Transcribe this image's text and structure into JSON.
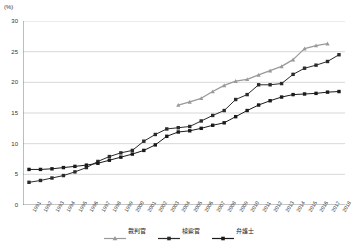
{
  "chart_data": {
    "type": "line",
    "title": "",
    "subtitle": "",
    "xlabel": "",
    "ylabel": "(%)",
    "unit_label": "(%)",
    "ylim": [
      0,
      30
    ],
    "y_ticks": [
      "0",
      "5",
      "10",
      "15",
      "20",
      "25",
      "30"
    ],
    "grid": true,
    "legend_position": "bottom",
    "categories": [
      "1991",
      "1992",
      "1993",
      "1994",
      "1995",
      "1996",
      "1997",
      "1998",
      "1999",
      "2000",
      "2001",
      "2002",
      "2003",
      "2004",
      "2005",
      "2006",
      "2007",
      "2008",
      "2009",
      "2010",
      "2011",
      "2012",
      "2013",
      "2014",
      "2015",
      "2016",
      "2017",
      "2018"
    ],
    "series": [
      {
        "name": "裁判官",
        "color": "#9a9a9a",
        "marker": "triangle",
        "values": [
          null,
          null,
          null,
          null,
          null,
          null,
          null,
          null,
          null,
          null,
          null,
          null,
          null,
          16.3,
          16.8,
          17.4,
          18.5,
          19.5,
          20.2,
          20.5,
          21.2,
          21.9,
          22.6,
          23.7,
          25.5,
          26.0,
          26.3,
          null
        ]
      },
      {
        "name": "検察官",
        "color": "#2b2b2b",
        "marker": "square",
        "values": [
          3.7,
          4.0,
          4.4,
          4.8,
          5.4,
          6.1,
          7.1,
          7.9,
          8.5,
          8.9,
          10.4,
          11.5,
          12.4,
          12.6,
          12.8,
          13.7,
          14.6,
          15.4,
          17.2,
          18.0,
          19.6,
          19.6,
          19.8,
          21.3,
          22.3,
          22.8,
          23.4,
          24.5
        ]
      },
      {
        "name": "弁護士",
        "color": "#1a1a1a",
        "marker": "square",
        "values": [
          5.8,
          5.8,
          5.9,
          6.1,
          6.3,
          6.5,
          6.8,
          7.3,
          7.8,
          8.3,
          8.9,
          9.8,
          11.2,
          11.9,
          12.1,
          12.5,
          13.0,
          13.4,
          14.4,
          15.4,
          16.3,
          17.0,
          17.6,
          18.0,
          18.1,
          18.2,
          18.4,
          18.5
        ]
      }
    ]
  },
  "legend": {
    "items": [
      {
        "label": "裁判官",
        "marker": "triangle",
        "color": "#9a9a9a"
      },
      {
        "label": "検察官",
        "marker": "square",
        "color": "#2b2b2b"
      },
      {
        "label": "弁護士",
        "marker": "square",
        "color": "#1a1a1a"
      }
    ]
  }
}
